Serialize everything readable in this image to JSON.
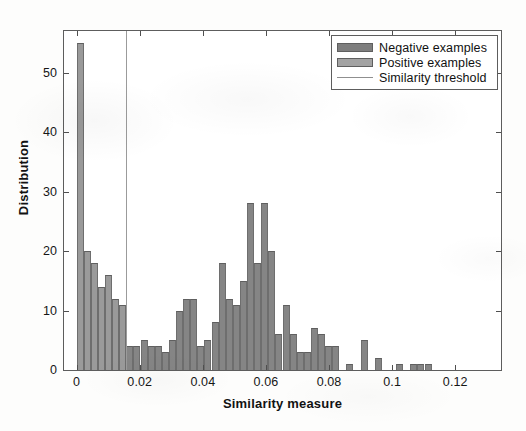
{
  "figure": {
    "width": 526,
    "height": 431,
    "background_color": "#fdfdfc",
    "axes_color": "#5d5d5d"
  },
  "axes_box": {
    "left": 63,
    "top": 30,
    "width": 439,
    "height": 341
  },
  "legend": {
    "position": "top-right",
    "border_color": "#5d5d5d",
    "entries": [
      {
        "label": "Negative examples",
        "swatch": "negative-swatch",
        "color": "#7e7e7e",
        "kind": "patch"
      },
      {
        "label": "Positive examples",
        "swatch": "positive-swatch",
        "color": "#a3a3a3",
        "kind": "patch"
      },
      {
        "label": "Similarity threshold",
        "swatch": "threshold-line-swatch",
        "color": "#8f8f8f",
        "kind": "line"
      }
    ]
  },
  "chart_data": {
    "type": "bar",
    "subtype": "histogram",
    "title": "",
    "xlabel": "Similarity measure",
    "ylabel": "Distribution",
    "xlim": [
      -0.004,
      0.1345
    ],
    "ylim": [
      0,
      57
    ],
    "xticks": [
      0,
      0.02,
      0.04,
      0.06,
      0.08,
      0.1,
      0.12
    ],
    "xticklabels": [
      "0",
      "0.02",
      "0.04",
      "0.06",
      "0.08",
      "0.1",
      "0.12"
    ],
    "yticks": [
      0,
      10,
      20,
      30,
      40,
      50
    ],
    "yticklabels": [
      "0",
      "10",
      "20",
      "30",
      "40",
      "50"
    ],
    "grid": false,
    "bin_width": 0.00225,
    "bar_color": "#8d8d8d",
    "bar_edge_color": "#6e6e6e",
    "annotations": [
      {
        "name": "similarity-threshold",
        "kind": "vline",
        "x": 0.0155,
        "color": "#9b9b9b",
        "label": "Similarity threshold"
      }
    ],
    "series": [
      {
        "name": "Positive examples",
        "color": "#9a9a9a",
        "note": "left mode, below the similarity threshold",
        "x": [
          0.0011,
          0.0034,
          0.0056,
          0.0079,
          0.0101,
          0.0124,
          0.0146
        ],
        "values": [
          55,
          20,
          18,
          14,
          16,
          12,
          11
        ]
      },
      {
        "name": "Negative examples",
        "color": "#858585",
        "note": "right mode, above the similarity threshold",
        "x": [
          0.0169,
          0.0191,
          0.0214,
          0.0236,
          0.0259,
          0.0281,
          0.0304,
          0.0326,
          0.0349,
          0.0371,
          0.0394,
          0.0416,
          0.0439,
          0.0461,
          0.0484,
          0.0506,
          0.0529,
          0.0551,
          0.0574,
          0.0596,
          0.0619,
          0.0641,
          0.0664,
          0.0686,
          0.0709,
          0.0731,
          0.0754,
          0.0776,
          0.0799,
          0.0821,
          0.0844,
          0.0866,
          0.0889,
          0.0911,
          0.0934,
          0.0956,
          0.0979,
          0.1001,
          0.1024,
          0.1046,
          0.1069,
          0.1091,
          0.1114
        ],
        "values": [
          4,
          4,
          5,
          4,
          4,
          3,
          5,
          10,
          12,
          12,
          4,
          5,
          8,
          18,
          12,
          11,
          15,
          28,
          18,
          28,
          20,
          6,
          11,
          6,
          3,
          3,
          7,
          6,
          4,
          4,
          0,
          1,
          0,
          5,
          0,
          2,
          0,
          0,
          1,
          0,
          1,
          1,
          1
        ]
      }
    ]
  }
}
